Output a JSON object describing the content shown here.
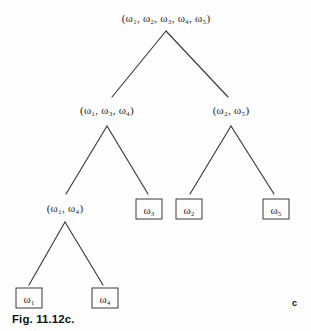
{
  "figure": {
    "caption": "Fig. 11.12c.",
    "panel_letter": "c",
    "background_color": "#fefefe",
    "line_color": "#3a3a3a",
    "text_color": "#1c1c1c"
  },
  "diagram": {
    "type": "dendrogram",
    "title": "",
    "nodes": [
      {
        "id": "root",
        "label": "(ω₁, ω₂, ω₃, ω₄, ω₅)",
        "members": [
          "ω₁",
          "ω₂",
          "ω₃",
          "ω₄",
          "ω₅"
        ],
        "level": 0,
        "x": 166,
        "y": 18,
        "boxed": false
      },
      {
        "id": "n134",
        "label": "(ω₁, ω₃, ω₄)",
        "members": [
          "ω₁",
          "ω₃",
          "ω₄"
        ],
        "level": 1,
        "x": 107,
        "y": 110,
        "boxed": false
      },
      {
        "id": "n25",
        "label": "(ω₂, ω₅)",
        "members": [
          "ω₂",
          "ω₅"
        ],
        "level": 1,
        "x": 231,
        "y": 110,
        "boxed": false
      },
      {
        "id": "n14",
        "label": "(ω₁, ω₄)",
        "members": [
          "ω₁",
          "ω₄"
        ],
        "level": 2,
        "x": 65,
        "y": 208,
        "boxed": false
      },
      {
        "id": "leaf3",
        "label": "ω₃",
        "members": [
          "ω₃"
        ],
        "level": 2,
        "x": 149,
        "y": 209,
        "boxed": true
      },
      {
        "id": "leaf2",
        "label": "ω₂",
        "members": [
          "ω₂"
        ],
        "level": 2,
        "x": 189,
        "y": 209,
        "boxed": true
      },
      {
        "id": "leaf5",
        "label": "ω₅",
        "members": [
          "ω₅"
        ],
        "level": 2,
        "x": 276,
        "y": 209,
        "boxed": true
      },
      {
        "id": "leaf1",
        "label": "ω₁",
        "members": [
          "ω₁"
        ],
        "level": 3,
        "x": 29,
        "y": 298,
        "boxed": true
      },
      {
        "id": "leaf4",
        "label": "ω₄",
        "members": [
          "ω₄"
        ],
        "level": 3,
        "x": 105,
        "y": 298,
        "boxed": true
      }
    ],
    "edges": [
      {
        "from": "root",
        "to": "n134",
        "x1": 166,
        "y1": 31,
        "x2": 112,
        "y2": 97
      },
      {
        "from": "root",
        "to": "n25",
        "x1": 166,
        "y1": 31,
        "x2": 228,
        "y2": 97
      },
      {
        "from": "n134",
        "to": "n14",
        "x1": 107,
        "y1": 126,
        "x2": 66,
        "y2": 194
      },
      {
        "from": "n134",
        "to": "leaf3",
        "x1": 107,
        "y1": 126,
        "x2": 148,
        "y2": 194
      },
      {
        "from": "n25",
        "to": "leaf2",
        "x1": 231,
        "y1": 126,
        "x2": 190,
        "y2": 194
      },
      {
        "from": "n25",
        "to": "leaf5",
        "x1": 231,
        "y1": 126,
        "x2": 274,
        "y2": 194
      },
      {
        "from": "n14",
        "to": "leaf1",
        "x1": 65,
        "y1": 222,
        "x2": 29,
        "y2": 285
      },
      {
        "from": "n14",
        "to": "leaf4",
        "x1": 65,
        "y1": 222,
        "x2": 103,
        "y2": 285
      }
    ]
  },
  "labels": {
    "root": {
      "text": "(ω₁, ω₂, ω₃, ω₄, ω₅)"
    },
    "n134": {
      "text": "(ω₁, ω₃, ω₄)"
    },
    "n25": {
      "text": "(ω₂, ω₅)"
    },
    "n14": {
      "text": "(ω₁, ω₄)"
    },
    "leaf3": {
      "text": "ω₃"
    },
    "leaf2": {
      "text": "ω₂"
    },
    "leaf5": {
      "text": "ω₅"
    },
    "leaf1": {
      "text": "ω₁"
    },
    "leaf4": {
      "text": "ω₄"
    }
  }
}
